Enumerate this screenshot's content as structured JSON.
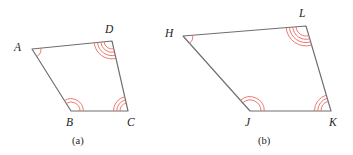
{
  "figure": {
    "background_color": "#ffffff",
    "edge_color": "#6e6e6e",
    "arc_color": "#e8736a",
    "label_color": "#1d1d1d",
    "caption_color": "#262626",
    "panels": [
      {
        "id": "panel-a",
        "caption": "(a)",
        "caption_x": 72,
        "caption_y": 136,
        "polygon_name": "ABCD",
        "vertices": [
          {
            "name": "A",
            "label": "A",
            "x": 32,
            "y": 49,
            "label_x": 14,
            "label_y": 42,
            "arcs": 1,
            "arc_radius_start": 9
          },
          {
            "name": "B",
            "label": "B",
            "x": 71,
            "y": 111,
            "label_x": 66,
            "label_y": 117,
            "arcs": 2,
            "arc_radius_start": 9
          },
          {
            "name": "C",
            "label": "C",
            "x": 128,
            "y": 111,
            "label_x": 127,
            "label_y": 117,
            "arcs": 3,
            "arc_radius_start": 8
          },
          {
            "name": "D",
            "label": "D",
            "x": 112,
            "y": 41,
            "label_x": 105,
            "label_y": 24,
            "arcs": 4,
            "arc_radius_start": 8
          }
        ]
      },
      {
        "id": "panel-b",
        "caption": "(b)",
        "caption_x": 258,
        "caption_y": 136,
        "polygon_name": "HJKL",
        "vertices": [
          {
            "name": "H",
            "label": "H",
            "x": 183,
            "y": 36,
            "label_x": 165,
            "label_y": 28,
            "arcs": 1,
            "arc_radius_start": 10
          },
          {
            "name": "J",
            "label": "J",
            "x": 250,
            "y": 111,
            "label_x": 245,
            "label_y": 117,
            "arcs": 2,
            "arc_radius_start": 11
          },
          {
            "name": "K",
            "label": "K",
            "x": 331,
            "y": 111,
            "label_x": 329,
            "label_y": 117,
            "arcs": 3,
            "arc_radius_start": 10
          },
          {
            "name": "L",
            "label": "L",
            "x": 306,
            "y": 26,
            "label_x": 299,
            "label_y": 8,
            "arcs": 4,
            "arc_radius_start": 10
          }
        ]
      }
    ]
  }
}
